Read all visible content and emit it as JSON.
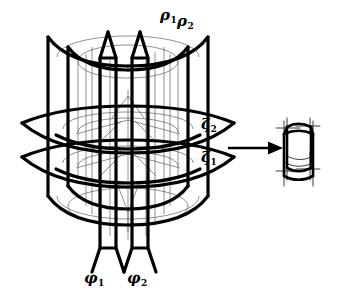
{
  "figure": {
    "background_color": "#ffffff",
    "ink_color": "#000000",
    "labels": {
      "rho1": "ρ",
      "rho1_sub": "1",
      "rho2": "ρ",
      "rho2_sub": "2",
      "zeta2": "ζ",
      "zeta2_sub": "2",
      "zeta1": "ζ",
      "zeta1_sub": "1",
      "phi1": "φ",
      "phi1_sub": "1",
      "phi2": "φ",
      "phi2_sub": "2"
    },
    "elements": {
      "rho_surfaces_count": 2,
      "zeta_surfaces_count": 2,
      "phi_surfaces_count": 2,
      "arrow_direction": "right",
      "result_cell": "curvilinear-hexahedron"
    }
  }
}
